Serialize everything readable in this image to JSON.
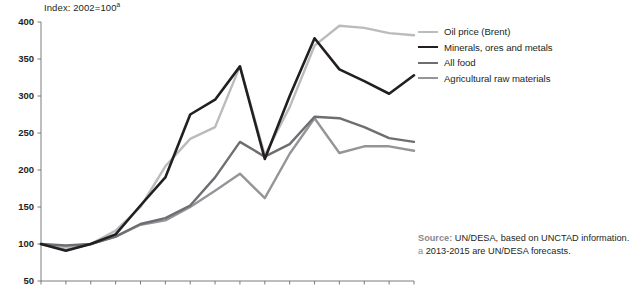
{
  "chart_data": {
    "type": "line",
    "title": "Index: 2002=100",
    "title_footnote_marker": "a",
    "xlabel": "",
    "ylabel": "",
    "grid": false,
    "legend_position": "right-top",
    "x": [
      2000,
      2001,
      2002,
      2003,
      2004,
      2005,
      2006,
      2007,
      2008,
      2009,
      2010,
      2011,
      2012,
      2013,
      2014,
      2015
    ],
    "xlim": [
      2000,
      2015
    ],
    "ylim": [
      50,
      400
    ],
    "ytick_values": [
      50,
      100,
      150,
      200,
      250,
      300,
      350,
      400
    ],
    "ytick_labels": [
      "50",
      "100",
      "150",
      "200",
      "250",
      "300",
      "350",
      "400"
    ],
    "xtick_labels": [
      "2000",
      "2001",
      "2002",
      "2003",
      "2004",
      "2005",
      "2006",
      "2007",
      "2008",
      "2009",
      "2010",
      "2011",
      "2012",
      "2013",
      "2014",
      "2015"
    ],
    "series": [
      {
        "name": "Oil price (Brent)",
        "color": "#b9bbbd",
        "width": 2.4,
        "values": [
          100,
          96,
          100,
          118,
          150,
          205,
          242,
          258,
          340,
          220,
          285,
          368,
          395,
          392,
          385,
          382
        ]
      },
      {
        "name": "Minerals, ores and metals",
        "color": "#231f20",
        "width": 2.6,
        "values": [
          100,
          91,
          100,
          113,
          152,
          190,
          275,
          295,
          340,
          215,
          300,
          378,
          336,
          320,
          303,
          328
        ]
      },
      {
        "name": "All food",
        "color": "#6d6e71",
        "width": 2.4,
        "values": [
          100,
          98,
          100,
          110,
          127,
          135,
          152,
          190,
          238,
          218,
          235,
          272,
          270,
          258,
          243,
          238
        ]
      },
      {
        "name": "Agricultural raw materials",
        "color": "#939598",
        "width": 2.4,
        "values": [
          100,
          92,
          100,
          110,
          126,
          132,
          150,
          172,
          195,
          162,
          222,
          270,
          223,
          232,
          232,
          226
        ]
      }
    ]
  },
  "source": {
    "label": "Source:",
    "text": "UN/DESA, based on UNCTAD information.",
    "footnote_marker": "a",
    "footnote_text": "2013-2015 are UN/DESA forecasts."
  }
}
